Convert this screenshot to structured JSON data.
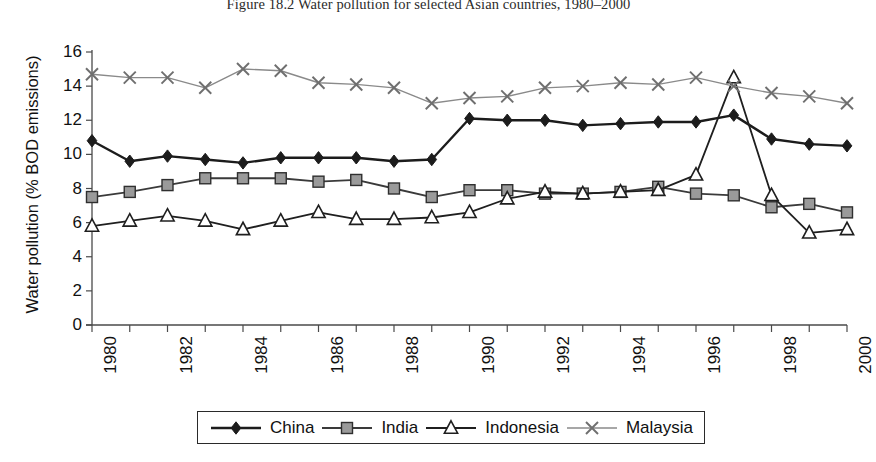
{
  "figure": {
    "title": "Figure 18.2 Water pollution for selected Asian countries, 1980–2000"
  },
  "axes": {
    "y_title": "Water pollution (% BOD emissions)",
    "x_title": ""
  },
  "legend": {
    "items": [
      {
        "label": "China",
        "marker": "filled-diamond",
        "color": "#2b2b2b"
      },
      {
        "label": "India",
        "marker": "filled-square",
        "color": "#8c8c8c"
      },
      {
        "label": "Indonesia",
        "marker": "open-triangle",
        "color": "#1f1f1f"
      },
      {
        "label": "Malaysia",
        "marker": "cross-x",
        "color": "#8a8a8a"
      }
    ]
  },
  "chart_data": {
    "type": "line",
    "title": "Figure 18.2 Water pollution for selected Asian countries, 1980–2000",
    "xlabel": "",
    "ylabel": "Water pollution (% BOD emissions)",
    "ylim": [
      0,
      16
    ],
    "yticks": [
      0,
      2,
      4,
      6,
      8,
      10,
      12,
      14,
      16
    ],
    "ytick_labels": [
      "0",
      "2",
      "4",
      "6",
      "8",
      "10",
      "12",
      "14",
      "16"
    ],
    "xlim": [
      1980,
      2000
    ],
    "x": [
      1980,
      1981,
      1982,
      1983,
      1984,
      1985,
      1986,
      1987,
      1988,
      1989,
      1990,
      1991,
      1992,
      1993,
      1994,
      1995,
      1996,
      1997,
      1998,
      1999,
      2000
    ],
    "xtick_labels": [
      "1980",
      "",
      "1982",
      "",
      "1984",
      "",
      "1986",
      "",
      "1988",
      "",
      "1990",
      "",
      "1992",
      "",
      "1994",
      "",
      "1996",
      "",
      "1998",
      "",
      "2000"
    ],
    "xtick_labels_shown": [
      "1980",
      "1982",
      "1984",
      "1986",
      "1988",
      "1990",
      "1992",
      "1994",
      "1996",
      "1998",
      "2000"
    ],
    "grid": false,
    "legend_position": "bottom",
    "series": [
      {
        "name": "China",
        "marker": "filled-diamond",
        "color": "#2b2b2b",
        "values": [
          10.8,
          9.6,
          9.9,
          9.7,
          9.5,
          9.8,
          9.8,
          9.8,
          9.6,
          9.7,
          12.1,
          12.0,
          12.0,
          11.7,
          11.8,
          11.9,
          11.9,
          12.3,
          10.9,
          10.6,
          10.5
        ]
      },
      {
        "name": "India",
        "marker": "filled-square",
        "color": "#8c8c8c",
        "values": [
          7.5,
          7.8,
          8.2,
          8.6,
          8.6,
          8.6,
          8.4,
          8.5,
          8.0,
          7.5,
          7.9,
          7.9,
          7.7,
          7.7,
          7.8,
          8.1,
          7.7,
          7.6,
          6.9,
          7.1,
          6.6
        ]
      },
      {
        "name": "Indonesia",
        "marker": "open-triangle",
        "color": "#1f1f1f",
        "values": [
          5.8,
          6.1,
          6.4,
          6.1,
          5.6,
          6.1,
          6.6,
          6.2,
          6.2,
          6.3,
          6.6,
          7.4,
          7.8,
          7.7,
          7.8,
          7.9,
          8.8,
          14.5,
          7.6,
          5.4,
          5.6
        ]
      },
      {
        "name": "Malaysia",
        "marker": "cross-x",
        "color": "#8a8a8a",
        "values": [
          14.7,
          14.5,
          14.5,
          13.9,
          15.0,
          14.9,
          14.2,
          14.1,
          13.9,
          13.0,
          13.3,
          13.4,
          13.9,
          14.0,
          14.2,
          14.1,
          14.5,
          14.0,
          13.6,
          13.4,
          13.0
        ]
      }
    ]
  }
}
